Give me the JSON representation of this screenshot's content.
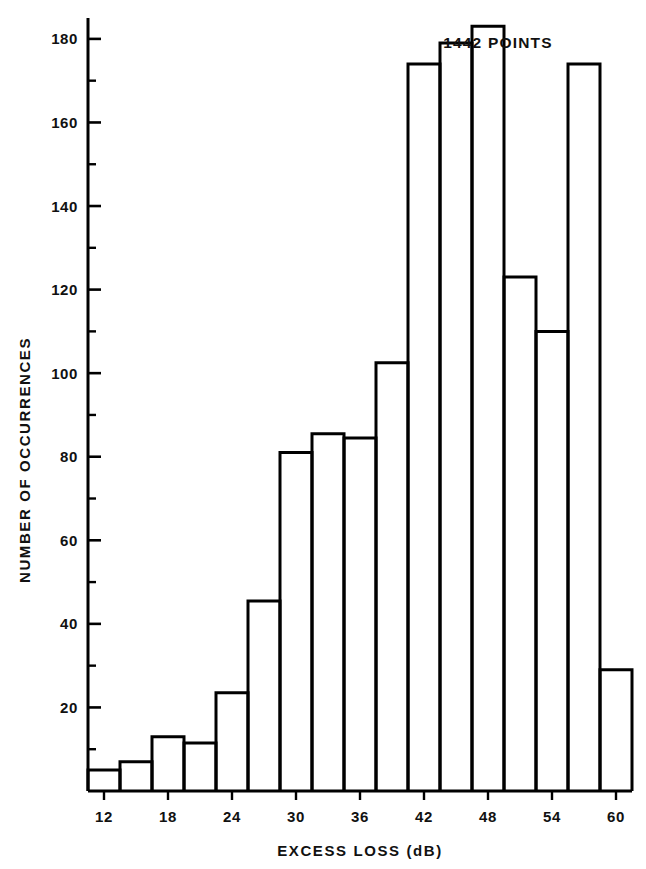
{
  "chart_data": {
    "type": "bar",
    "title": "",
    "xlabel": "EXCESS LOSS (dB)",
    "ylabel": "NUMBER OF OCCURRENCES",
    "annotation": "1442 POINTS",
    "bin_width": 3,
    "x_start": 10.5,
    "xlim": [
      10.5,
      61.5
    ],
    "ylim": [
      0,
      185
    ],
    "grid": false,
    "legend": null,
    "xticks": [
      12,
      18,
      24,
      30,
      36,
      42,
      48,
      54,
      60
    ],
    "xtick_labels": [
      "12",
      "18",
      "24",
      "30",
      "36",
      "42",
      "48",
      "54",
      "60"
    ],
    "xminor_step": 3,
    "yticks": [
      20,
      40,
      60,
      80,
      100,
      120,
      140,
      160,
      180
    ],
    "ytick_labels": [
      "20",
      "40",
      "60",
      "80",
      "100",
      "120",
      "140",
      "160",
      "180"
    ],
    "yminor_step": 10,
    "bin_edges": [
      10.5,
      13.5,
      16.5,
      19.5,
      22.5,
      25.5,
      28.5,
      31.5,
      34.5,
      37.5,
      40.5,
      43.5,
      46.5,
      49.5,
      52.5,
      55.5,
      58.5,
      61.5
    ],
    "categories": [
      "10.5-13.5",
      "13.5-16.5",
      "16.5-19.5",
      "19.5-22.5",
      "22.5-25.5",
      "25.5-28.5",
      "28.5-31.5",
      "31.5-34.5",
      "34.5-37.5",
      "37.5-40.5",
      "40.5-43.5",
      "43.5-46.5",
      "46.5-49.5",
      "49.5-52.5",
      "52.5-55.5",
      "55.5-58.5",
      "58.5-61.5"
    ],
    "values": [
      5,
      7,
      13,
      11.5,
      23.5,
      45.5,
      81,
      85.5,
      84.5,
      102.5,
      174,
      179,
      183,
      123,
      110,
      174,
      29
    ],
    "bar_style": {
      "fill": "#ffffff",
      "edge": "#000000",
      "edge_width": 3
    }
  },
  "figure": {
    "background": "#ffffff",
    "axis_color": "#000000",
    "text_color": "#111111"
  }
}
